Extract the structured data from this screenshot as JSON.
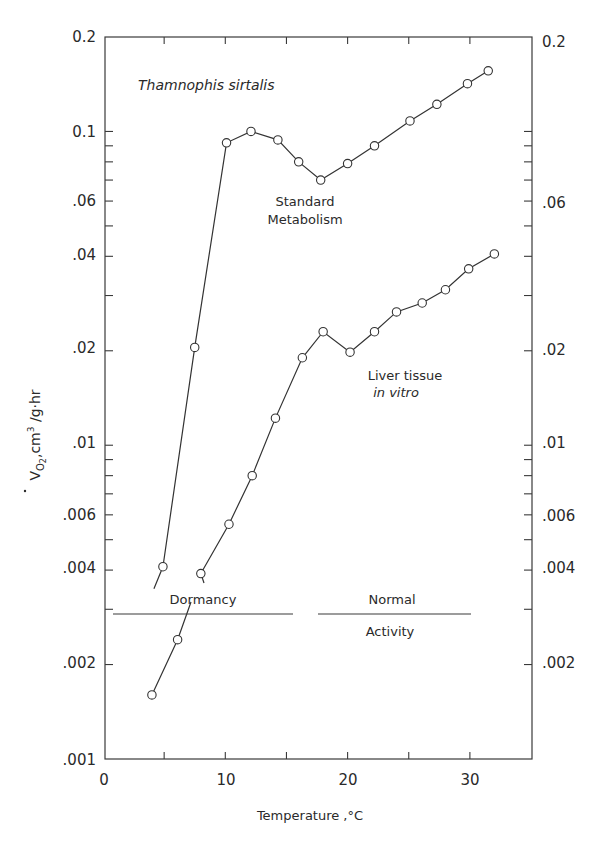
{
  "chart_data": {
    "type": "line",
    "title": "Thamnophis sirtalis",
    "xlabel": "Temperature, °C",
    "ylabel": "V̇O2, cm³/g·hr",
    "xscale": "linear",
    "yscale": "log",
    "xlim": [
      0,
      35
    ],
    "ylim": [
      0.001,
      0.2
    ],
    "x_ticks": [
      0,
      10,
      20,
      30
    ],
    "x_tick_labels": [
      "0",
      "10",
      "20",
      "30"
    ],
    "y_ticks": [
      0.2,
      0.1,
      0.06,
      0.04,
      0.02,
      0.01,
      0.006,
      0.004,
      0.002,
      0.001
    ],
    "y_tick_labels_left": [
      "0.2",
      "0.1",
      ".06",
      ".04",
      ".02",
      ".01",
      ".006",
      ".004",
      ".002",
      ".001"
    ],
    "y_tick_labels_right": [
      "0.2",
      ".06",
      ".02",
      ".01",
      ".006",
      ".004",
      ".002"
    ],
    "grid": false,
    "legend": "none (series labeled inline)",
    "series": [
      {
        "name": "Standard Metabolism",
        "label_lines": [
          "Standard",
          "Metabolism"
        ],
        "marker": "open-circle",
        "x": [
          4.9,
          7.5,
          10.1,
          12.1,
          14.3,
          16.0,
          17.8,
          20.0,
          22.2,
          25.1,
          27.3,
          29.8,
          31.5
        ],
        "y": [
          0.0041,
          0.0205,
          0.092,
          0.1,
          0.094,
          0.08,
          0.07,
          0.079,
          0.09,
          0.108,
          0.122,
          0.142,
          0.156
        ]
      },
      {
        "name": "Liver tissue in vitro",
        "label_lines": [
          "Liver tissue",
          "in vitro"
        ],
        "marker": "open-circle",
        "x": [
          4.0,
          6.1,
          8.0,
          10.3,
          12.2,
          14.1,
          16.3,
          18.0,
          20.2,
          22.2,
          24.0,
          26.1,
          28.0,
          29.9,
          32.0
        ],
        "y": [
          0.0016,
          0.0024,
          0.0039,
          0.0056,
          0.008,
          0.0122,
          0.019,
          0.023,
          0.0198,
          0.023,
          0.0266,
          0.0284,
          0.0313,
          0.0365,
          0.0407
        ]
      }
    ],
    "annotations": [
      {
        "text": "Dormancy",
        "x_range": [
          0.8,
          15.6
        ],
        "y": 0.0029,
        "position": "above line"
      },
      {
        "text": "Normal",
        "x_range": [
          17.6,
          30.0
        ],
        "y": 0.0029,
        "position": "above line"
      },
      {
        "text": "Activity",
        "x_range": [
          17.6,
          30.0
        ],
        "y": 0.0029,
        "position": "below line"
      }
    ]
  },
  "labels": {
    "title": "Thamnophis sirtalis",
    "xlabel": "Temperature ,°C",
    "ylabel_main": "V",
    "ylabel_sub": "O",
    "ylabel_sub2": "2",
    "ylabel_rest": ",cm",
    "ylabel_sup": "3",
    "ylabel_tail": " /g·hr",
    "series1_line1": "Standard",
    "series1_line2": "Metabolism",
    "series2_line1": "Liver tissue",
    "series2_line2": "in vitro",
    "dormancy": "Dormancy",
    "normal": "Normal",
    "activity": "Activity",
    "x0": "0",
    "x10": "10",
    "x20": "20",
    "x30": "30",
    "yl_02": "0.2",
    "yl_01": "0.1",
    "yl_006": ".06",
    "yl_004": ".04",
    "yl_002": ".02",
    "yl_001": ".01",
    "yl_0006": ".006",
    "yl_0004": ".004",
    "yl_0002": ".002",
    "yl_0001": ".001",
    "yr_02": "0.2",
    "yr_006": ".06",
    "yr_002": ".02",
    "yr_001": ".01",
    "yr_0006": ".006",
    "yr_0004": ".004",
    "yr_0002": ".002"
  }
}
